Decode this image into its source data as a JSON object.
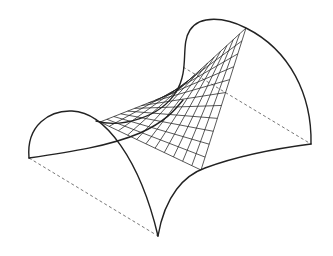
{
  "diagram": {
    "title": "",
    "colors": {
      "background": "#ffffff",
      "stroke": "#222222",
      "dashed": "#666666"
    },
    "corners": {
      "left": [
        29,
        158
      ],
      "bottom": [
        158,
        236
      ],
      "right": [
        311,
        144
      ],
      "back": [
        183,
        67
      ]
    },
    "ruled_patch": {
      "saddle_point": [
        100,
        122
      ],
      "apex": [
        246,
        28
      ],
      "lower_corner": [
        201,
        170
      ],
      "divisions": 11
    }
  }
}
